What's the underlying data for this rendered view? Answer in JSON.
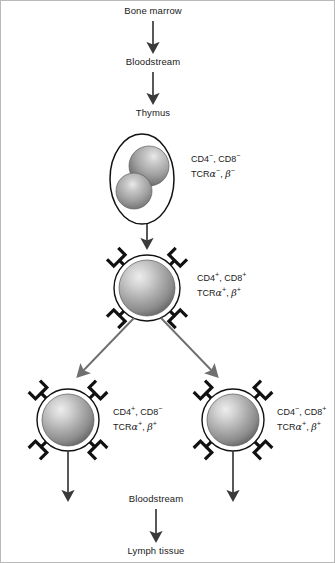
{
  "figure": {
    "background": "#ffffff",
    "border_color": "#b9b9b9"
  },
  "stages": {
    "bone_marrow": "Bone marrow",
    "bloodstream_top": "Bloodstream",
    "thymus": "Thymus",
    "bloodstream_bottom": "Bloodstream",
    "lymph_tissue": "Lymph tissue"
  },
  "cells": [
    {
      "id": "double-negative",
      "name": "double-negative-thymocyte",
      "shape": "ellipse-with-two-spheres",
      "receptors": 0,
      "markers": {
        "line1": [
          {
            "text": "CD4",
            "sup": "−"
          },
          {
            "text": ", CD8",
            "sup": "−"
          }
        ],
        "line2_prefix": "TCR",
        "line2": [
          {
            "greek": "α",
            "sup": "−"
          },
          {
            "text": ", ",
            "greek": "β",
            "sup": "−"
          }
        ],
        "line1_text": "CD4−, CD8−",
        "line2_text": "TCRα−, β−"
      }
    },
    {
      "id": "double-positive",
      "name": "double-positive-thymocyte",
      "shape": "sphere-with-receptors",
      "receptors": 4,
      "markers": {
        "line1_text": "CD4+, CD8+",
        "line2_text": "TCRα+, β+"
      }
    },
    {
      "id": "cd4-single-positive",
      "name": "helper-t-cell",
      "shape": "sphere-with-receptors",
      "receptors": 4,
      "markers": {
        "line1_text": "CD4+, CD8−",
        "line2_text": "TCRα+, β+"
      }
    },
    {
      "id": "cd8-single-positive",
      "name": "cytotoxic-t-cell",
      "shape": "sphere-with-receptors",
      "receptors": 4,
      "markers": {
        "line1_text": "CD4−, CD8+",
        "line2_text": "TCRα+, β+"
      }
    }
  ],
  "colors": {
    "arrow_dark": "#3a3a3a",
    "arrow_gray": "#6f6f6f",
    "sphere_highlight": "#e8e8e8",
    "sphere_mid": "#a8a8a8",
    "sphere_edge": "#6d6d6d",
    "outline": "#111111",
    "ring": "#ffffff",
    "text": "#1a1a1a"
  }
}
